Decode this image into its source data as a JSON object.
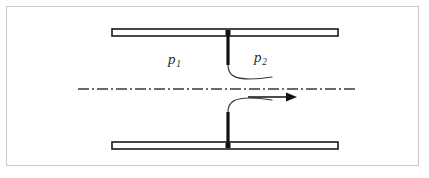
{
  "figure": {
    "kind": "engineering-diagram",
    "width": 429,
    "height": 178,
    "background_color": "#ffffff"
  },
  "frame": {
    "name": "figure-border",
    "color": "#c8c8c8",
    "x": 6,
    "y": 6,
    "width": 412,
    "height": 159,
    "stroke_width": 1
  },
  "labels": {
    "upstream_pressure": {
      "symbol": "p",
      "subscript": "1",
      "text": "p1",
      "x": 168,
      "y": 52,
      "color": "#2b2b2b"
    },
    "downstream_pressure": {
      "symbol": "p",
      "subscript": "2",
      "text": "p2",
      "x": 254,
      "y": 50,
      "color": "#2b2b2b"
    }
  },
  "pipe": {
    "wall_color": "#1a1a1a",
    "wall_fill": "#ffffff",
    "wall_stroke_width": 1.6,
    "left_x": 112,
    "right_x": 338,
    "top_wall": {
      "name": "pipe-wall-top",
      "y": 29,
      "height": 7
    },
    "bottom_wall": {
      "name": "pipe-wall-bottom",
      "y": 142,
      "height": 7
    }
  },
  "orifice_plate": {
    "name": "orifice-plate",
    "color": "#111111",
    "stroke_width": 3.2,
    "x": 228,
    "upper_segment": {
      "y_start": 33,
      "y_end": 65
    },
    "lower_segment": {
      "y_start": 112,
      "y_end": 146
    },
    "junction_square_size": 5,
    "junction_color": "#111111"
  },
  "streamlines": {
    "color": "#3a3a3a",
    "stroke_width": 1.2,
    "upper": {
      "name": "streamline-upper",
      "path": "M 228 65 C 228 76 236 79 250 79 C 259 79 266 78 272 77"
    },
    "lower": {
      "name": "streamline-lower",
      "path": "M 228 112 C 228 101 236 98 250 98 C 259 98 266 99 272 100"
    }
  },
  "centerline": {
    "name": "pipe-centerline",
    "y": 89,
    "x_start": 78,
    "x_end": 358,
    "color": "#3a3a3a",
    "stroke_width": 1.3,
    "dash_pattern": "11 3 2 3"
  },
  "flow_arrow": {
    "name": "flow-direction-arrow",
    "y": 97,
    "x_start": 248,
    "x_tip": 297,
    "color": "#111111",
    "shaft_stroke_width": 1.5,
    "head_length": 11,
    "head_half_width": 4.5,
    "direction": "right"
  }
}
